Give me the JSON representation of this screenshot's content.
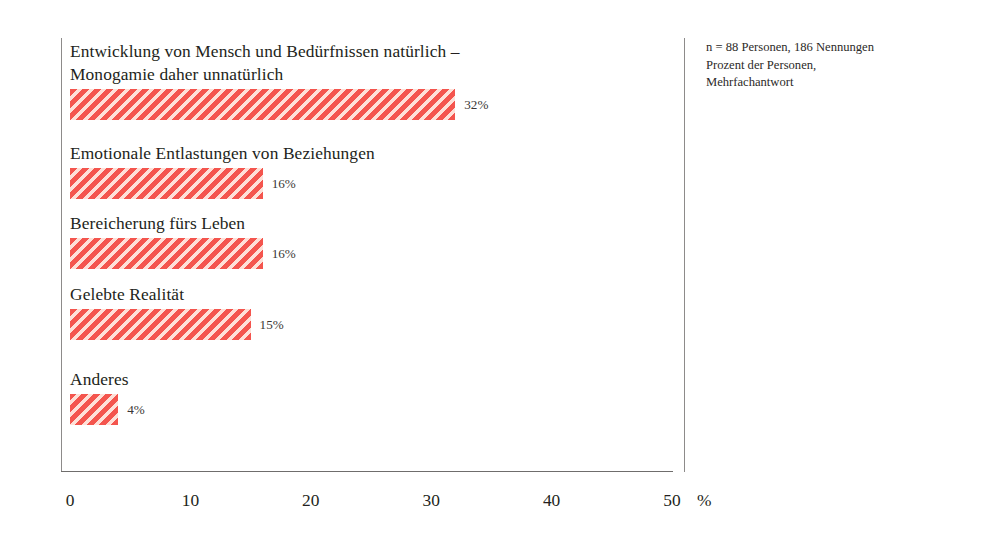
{
  "chart_data": {
    "type": "bar",
    "orientation": "horizontal",
    "title": "",
    "subtitle": "",
    "xlabel": "%",
    "ylabel": "",
    "xlim": [
      0,
      50
    ],
    "xticks": [
      0,
      10,
      20,
      30,
      40,
      50
    ],
    "xtick_labels": [
      "0",
      "10",
      "20",
      "30",
      "40",
      "50"
    ],
    "grid": false,
    "legend": null,
    "unit_label": "%",
    "categories": [
      "Entwicklung von Mensch und Bedürfnissen natürlich –\nMonogamie daher unnatürlich",
      "Emotionale Entlastungen von Beziehungen",
      "Bereicherung fürs Leben",
      "Gelebte Realität",
      "Anderes"
    ],
    "values": [
      32,
      16,
      16,
      15,
      4
    ],
    "value_labels": [
      "32%",
      "16%",
      "16%",
      "15%",
      "4%"
    ],
    "bar_color": "#f4554e",
    "bar_hatch": "diagonal-stripes",
    "annotation": "n = 88 Personen, 186 Nennungen\nProzent der Personen,\nMehrfachantwort"
  },
  "note": {
    "text": "n = 88 Personen, 186 Nennungen\nProzent der Personen,\nMehrfachantwort"
  },
  "axis": {
    "unit": "%"
  }
}
